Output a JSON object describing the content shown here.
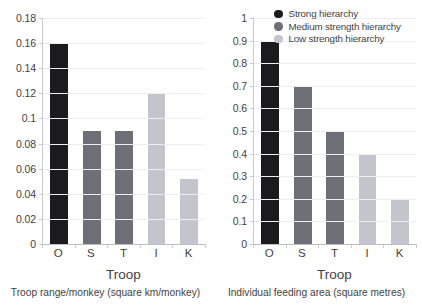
{
  "legend": {
    "position": "top-right",
    "entries": [
      {
        "label": "Strong hierarchy",
        "color": "#1b1b1e"
      },
      {
        "label": "Medium strength hierarchy",
        "color": "#6e6e76"
      },
      {
        "label": "Low strength hierarchy",
        "color": "#c4c4cc"
      }
    ]
  },
  "chart_data": [
    {
      "type": "bar",
      "title": "",
      "panel": "left",
      "categories": [
        "O",
        "S",
        "T",
        "I",
        "K"
      ],
      "values": [
        0.16,
        0.09,
        0.09,
        0.12,
        0.052
      ],
      "bar_colors": [
        "#1b1b1e",
        "#6e6e76",
        "#6e6e76",
        "#c4c4cc",
        "#c4c4cc"
      ],
      "series_labels": [
        "Strong hierarchy",
        "Medium strength hierarchy",
        "Medium strength hierarchy",
        "Low strength hierarchy",
        "Low strength hierarchy"
      ],
      "xlabel": "Troop",
      "ylabel": "",
      "caption": "Troop range/monkey (square km/monkey)",
      "ylim": [
        0,
        0.18
      ],
      "yticks": [
        0,
        0.02,
        0.04,
        0.06,
        0.08,
        0.1,
        0.12,
        0.14,
        0.16,
        0.18
      ],
      "ytick_labels": [
        "0",
        "0.02",
        "0.04",
        "0.06",
        "0.08",
        "0.1",
        "0.12",
        "0.14",
        "0.16",
        "0.18"
      ],
      "grid": true
    },
    {
      "type": "bar",
      "title": "",
      "panel": "right",
      "categories": [
        "O",
        "S",
        "T",
        "I",
        "K"
      ],
      "values": [
        0.9,
        0.7,
        0.5,
        0.4,
        0.2
      ],
      "bar_colors": [
        "#1b1b1e",
        "#6e6e76",
        "#6e6e76",
        "#c4c4cc",
        "#c4c4cc"
      ],
      "series_labels": [
        "Strong hierarchy",
        "Medium strength hierarchy",
        "Medium strength hierarchy",
        "Low strength hierarchy",
        "Low strength hierarchy"
      ],
      "xlabel": "Troop",
      "ylabel": "",
      "caption": "Individual feeding area (square metres)",
      "ylim": [
        0,
        1
      ],
      "yticks": [
        0,
        0.1,
        0.2,
        0.3,
        0.4,
        0.5,
        0.6,
        0.7,
        0.8,
        0.9,
        1
      ],
      "ytick_labels": [
        "0",
        "0.1",
        "0.2",
        "0.3",
        "0.4",
        "0.5",
        "0.6",
        "0.7",
        "0.8",
        "0.9",
        "1"
      ],
      "grid": true
    }
  ]
}
